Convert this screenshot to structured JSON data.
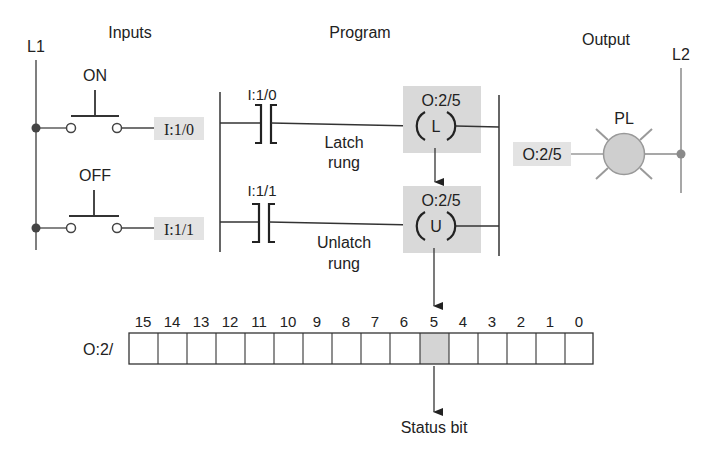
{
  "sections": {
    "inputs_title": "Inputs",
    "program_title": "Program",
    "output_title": "Output"
  },
  "rails": {
    "l1_label": "L1",
    "l2_label": "L2"
  },
  "inputs": [
    {
      "switch_label": "ON",
      "address": "I:1/0"
    },
    {
      "switch_label": "OFF",
      "address": "I:1/1"
    }
  ],
  "program": {
    "rungs": [
      {
        "contact_address": "I:1/0",
        "coil_address": "O:2/5",
        "coil_letter": "L",
        "rung_label_1": "Latch",
        "rung_label_2": "rung"
      },
      {
        "contact_address": "I:1/1",
        "coil_address": "O:2/5",
        "coil_letter": "U",
        "rung_label_1": "Unlatch",
        "rung_label_2": "rung"
      }
    ]
  },
  "output": {
    "address": "O:2/5",
    "lamp_label": "PL"
  },
  "status_word": {
    "label": "O:2/",
    "bits": [
      "15",
      "14",
      "13",
      "12",
      "11",
      "10",
      "9",
      "8",
      "7",
      "6",
      "5",
      "4",
      "3",
      "2",
      "1",
      "0"
    ],
    "highlighted_bit": "5",
    "status_label": "Status bit"
  },
  "colors": {
    "line": "#333333",
    "shade": "#d9d9d9",
    "lamp_fill": "#cfcfcf",
    "lamp_ray": "#9a9a9a",
    "rail_gray": "#8a8a8a"
  }
}
